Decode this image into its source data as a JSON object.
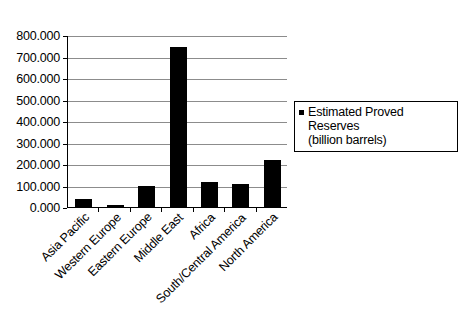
{
  "chart_data": {
    "type": "bar",
    "title": "",
    "xlabel": "",
    "ylabel": "",
    "ylim": [
      0,
      800
    ],
    "ytick_step": 100,
    "grid": true,
    "legend_position": "right",
    "categories": [
      "Asia Pacific",
      "Western Europe",
      "Eastern Europe",
      "Middle East",
      "Africa",
      "South/Central America",
      "North America"
    ],
    "series": [
      {
        "name": "Estimated Proved Reserves (billion barrels)",
        "values": [
          35,
          10,
          100,
          742,
          118,
          105,
          218
        ]
      }
    ],
    "ytick_labels": [
      "800.000",
      "700.000",
      "600.000",
      "500.000",
      "400.000",
      "300.000",
      "200.000",
      "100.000",
      "0.000"
    ],
    "ytick_values": [
      800,
      700,
      600,
      500,
      400,
      300,
      200,
      100,
      0
    ],
    "colors": {
      "bar": "#000000",
      "gridline": "#8c8c8c",
      "axis": "#000000",
      "background": "#ffffff",
      "text": "#000000"
    }
  },
  "legend": {
    "line1": "Estimated Proved Reserves",
    "line2": "(billion barrels)",
    "marker": "black-square-marker"
  }
}
